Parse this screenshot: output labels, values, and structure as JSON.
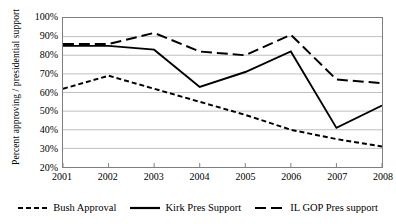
{
  "chart_data": {
    "type": "line",
    "title": "",
    "xlabel": "",
    "ylabel": "Percent approving / presidential support",
    "categories": [
      "2001",
      "2002",
      "2003",
      "2004",
      "2005",
      "2006",
      "2007",
      "2008"
    ],
    "x": [
      2001,
      2002,
      2003,
      2004,
      2005,
      2006,
      2007,
      2008
    ],
    "ylim": [
      20,
      100
    ],
    "ytick_labels": [
      "20%",
      "30%",
      "40%",
      "50%",
      "60%",
      "70%",
      "80%",
      "90%",
      "100%"
    ],
    "ytick_values": [
      20,
      30,
      40,
      50,
      60,
      70,
      80,
      90,
      100
    ],
    "grid": true,
    "legend_position": "bottom",
    "series": [
      {
        "name": "Bush Approval",
        "style": "short-dash",
        "values": [
          62,
          69,
          62,
          55,
          48,
          40,
          35,
          31
        ]
      },
      {
        "name": "Kirk Pres Support",
        "style": "solid",
        "values": [
          85,
          85,
          83,
          63,
          71,
          82,
          41,
          53
        ]
      },
      {
        "name": "IL GOP Pres support",
        "style": "long-dash",
        "values": [
          86,
          86,
          92,
          82,
          80,
          91,
          67,
          65
        ]
      }
    ]
  },
  "legend": {
    "items": [
      {
        "label": "Bush Approval",
        "key": "short-dash-key"
      },
      {
        "label": "Kirk Pres Support",
        "key": "solid-key"
      },
      {
        "label": "IL GOP Pres support",
        "key": "long-dash-key"
      }
    ]
  },
  "colors": {
    "line": "#000000",
    "grid": "#bfbfbf",
    "frame": "#7f7f7f",
    "background": "#ffffff"
  }
}
